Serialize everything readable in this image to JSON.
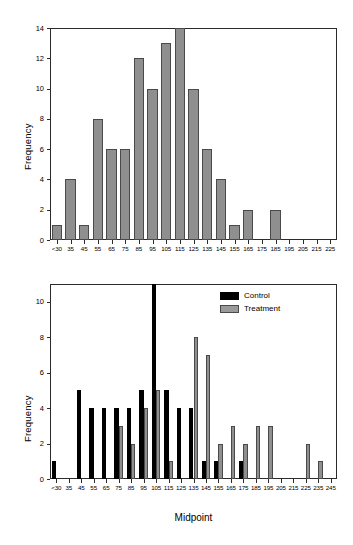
{
  "figure": {
    "background": "#ffffff",
    "control_color": "#000000",
    "treatment_color": "#8f8f8f",
    "axis_color": "#2b2b2b"
  },
  "chart_data": [
    {
      "type": "bar",
      "title": "",
      "subtitle": "",
      "panel": "top",
      "xlabel": "",
      "ylabel": "Frequency",
      "ylim": [
        0,
        14
      ],
      "yticks": [
        0,
        2,
        4,
        6,
        8,
        10,
        12,
        14
      ],
      "ytick_labels": [
        "0",
        "2",
        "4",
        "6",
        "8",
        "10",
        "12",
        "14"
      ],
      "grid": false,
      "legend": null,
      "categories": [
        "<30",
        "35",
        "45",
        "55",
        "65",
        "75",
        "85",
        "95",
        "105",
        "115",
        "125",
        "135",
        "145",
        "155",
        "165",
        "175",
        "185",
        "195",
        "205",
        "215",
        "225"
      ],
      "values": [
        1,
        4,
        1,
        8,
        6,
        6,
        12,
        10,
        13,
        14,
        10,
        6,
        4,
        1,
        2,
        0,
        2,
        0,
        0,
        0,
        0
      ]
    },
    {
      "type": "bar",
      "title": "",
      "subtitle": "",
      "panel": "bottom",
      "xlabel": "Midpoint",
      "ylabel": "Frequency",
      "ylim": [
        0,
        11
      ],
      "yticks": [
        0,
        2,
        4,
        6,
        8,
        10
      ],
      "ytick_labels": [
        "0",
        "2",
        "4",
        "6",
        "8",
        "10"
      ],
      "grid": false,
      "legend_position": "top-right",
      "categories": [
        "<30",
        "35",
        "45",
        "55",
        "65",
        "75",
        "85",
        "95",
        "105",
        "115",
        "125",
        "135",
        "145",
        "155",
        "165",
        "175",
        "185",
        "195",
        "205",
        "215",
        "225",
        "235",
        "245"
      ],
      "series": [
        {
          "name": "Control",
          "color": "#000000",
          "values": [
            1,
            0,
            5,
            4,
            4,
            4,
            4,
            5,
            11,
            5,
            4,
            4,
            1,
            1,
            0,
            1,
            0,
            0,
            0,
            0,
            0,
            0,
            0
          ]
        },
        {
          "name": "Treatment",
          "color": "#8f8f8f",
          "values": [
            0,
            0,
            0,
            0,
            0,
            3,
            2,
            4,
            5,
            1,
            0,
            8,
            7,
            2,
            3,
            2,
            3,
            3,
            0,
            0,
            2,
            1,
            0
          ]
        }
      ]
    }
  ],
  "legend": {
    "items": [
      {
        "label": "Control",
        "key": "control"
      },
      {
        "label": "Treatment",
        "key": "treatment"
      }
    ]
  },
  "axis_titles": {
    "top_ylabel": "Frequency",
    "bottom_ylabel": "Frequency",
    "bottom_xlabel": "Midpoint"
  }
}
